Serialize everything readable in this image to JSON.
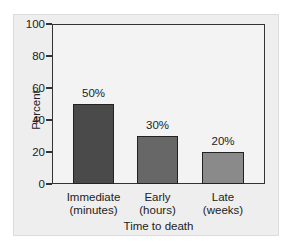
{
  "chart_data": {
    "type": "bar",
    "title": "",
    "xlabel": "Time to death",
    "ylabel": "Percent",
    "ylim": [
      0,
      100
    ],
    "yticks": [
      0,
      20,
      40,
      60,
      80,
      100
    ],
    "grid": false,
    "legend": null,
    "categories": [
      "Immediate (minutes)",
      "Early (hours)",
      "Late (weeks)"
    ],
    "category_lines": [
      [
        "Immediate",
        "(minutes)"
      ],
      [
        "Early",
        "(hours)"
      ],
      [
        "Late",
        "(weeks)"
      ]
    ],
    "values": [
      50,
      30,
      20
    ],
    "value_labels": [
      "50%",
      "30%",
      "20%"
    ],
    "colors": [
      "#4a4a4a",
      "#676767",
      "#8a8a8a"
    ]
  },
  "axis": {
    "y_ticks": [
      {
        "label": "100",
        "top": 24
      },
      {
        "label": "80",
        "top": 56
      },
      {
        "label": "60",
        "top": 88
      },
      {
        "label": "40",
        "top": 120
      },
      {
        "label": "20",
        "top": 152
      },
      {
        "label": "0",
        "top": 184
      }
    ]
  },
  "bars": [
    {
      "label": "50%",
      "line1": "Immediate",
      "line2": "(minutes)",
      "color": "#4a4a4a",
      "left": 73,
      "width": 41,
      "top": 104,
      "height": 80
    },
    {
      "label": "30%",
      "line1": "Early",
      "line2": "(hours)",
      "color": "#676767",
      "left": 137,
      "width": 41,
      "top": 136,
      "height": 48
    },
    {
      "label": "20%",
      "line1": "Late",
      "line2": "(weeks)",
      "color": "#8a8a8a",
      "left": 202,
      "width": 42,
      "top": 152,
      "height": 32
    }
  ]
}
